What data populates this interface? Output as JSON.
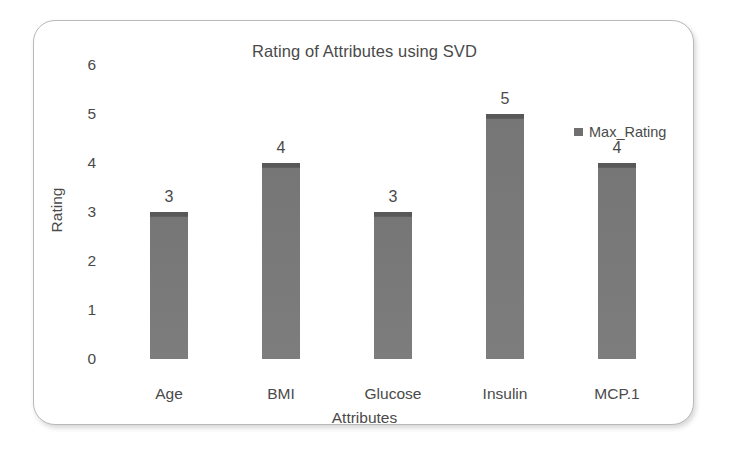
{
  "chart_data": {
    "type": "bar",
    "title": "Rating of Attributes using SVD",
    "xlabel": "Attributes",
    "ylabel": "Rating",
    "categories": [
      "Age",
      "BMI",
      "Glucose",
      "Insulin",
      "MCP.1"
    ],
    "values": [
      3,
      4,
      3,
      5,
      4
    ],
    "data_labels": [
      "3",
      "4",
      "3",
      "5",
      "4"
    ],
    "series": [
      {
        "name": "Max_Rating",
        "values": [
          3,
          4,
          3,
          5,
          4
        ]
      }
    ],
    "ylim": [
      0,
      6
    ],
    "yticks": [
      0,
      1,
      2,
      3,
      4,
      5,
      6
    ],
    "ytick_labels": [
      "0",
      "1",
      "2",
      "3",
      "4",
      "5",
      "6"
    ],
    "grid": false,
    "legend": {
      "position": "top-right",
      "entries": [
        "Max_Rating"
      ]
    },
    "colors": {
      "bar_fill": "#7a7a7a",
      "bar_cap": "#585858",
      "text": "#4a4a4a",
      "card_border": "#b9b9b9",
      "background": "#ffffff"
    }
  },
  "legend": {
    "marker_icon": "square-marker-icon",
    "label": "Max_Rating"
  }
}
